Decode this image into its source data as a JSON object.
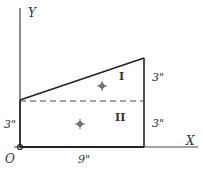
{
  "diagram": {
    "type": "composite-area centroid sketch",
    "axes": {
      "x_label": "X",
      "y_label": "Y",
      "origin_label": "O"
    },
    "regions": [
      {
        "id": "I",
        "label": "I",
        "shape": "triangle",
        "height_label": "3\"",
        "centroid_marker": true
      },
      {
        "id": "II",
        "label": "II",
        "shape": "rectangle",
        "height_label": "3\"",
        "centroid_marker": true
      }
    ],
    "dimensions": {
      "base": "9\"",
      "left_height": "3\"",
      "right_upper_height": "3\"",
      "right_lower_height": "3\""
    },
    "colors": {
      "stroke": "#333333",
      "background": "#ffffff"
    }
  }
}
